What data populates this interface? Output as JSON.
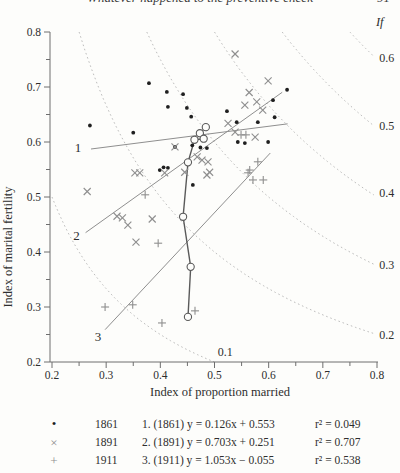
{
  "page_header": {
    "title": "Whatever happened to the preventive check",
    "page_number": "91"
  },
  "colors": {
    "dots": "#1f1f1f",
    "cross_plus": "#8f8f8f",
    "regression": "#8f8f8f",
    "trajectory": "#5a5a5a",
    "contour": "#bdbdbd",
    "axis": "#6e6e6e",
    "text": "#2e2e2e"
  },
  "chart_data": {
    "type": "scatter",
    "xlabel": "Index of proportion married",
    "ylabel": "Index of marital fertility",
    "xlim": [
      0.2,
      0.8
    ],
    "ylim": [
      0.2,
      0.8
    ],
    "tick_minor_step": 0.05,
    "tick_label_step": 0.1,
    "grid": false,
    "if_label": {
      "text": "If",
      "x": 0.805,
      "y": 0.818
    },
    "contours": [
      {
        "value": 0.1,
        "label": "0.1",
        "label_x": 0.52,
        "label_y": 0.218
      },
      {
        "value": 0.2,
        "label": "0.2",
        "label_x": 0.818,
        "label_y": 0.249
      },
      {
        "value": 0.3,
        "label": "0.3",
        "label_x": 0.818,
        "label_y": 0.376
      },
      {
        "value": 0.4,
        "label": "0.4",
        "label_x": 0.818,
        "label_y": 0.508
      },
      {
        "value": 0.5,
        "label": "0.5",
        "label_x": 0.818,
        "label_y": 0.63
      },
      {
        "value": 0.6,
        "label": "0.6",
        "label_x": 0.818,
        "label_y": 0.752
      }
    ],
    "series": [
      {
        "name": "1861",
        "marker": "dot",
        "points": [
          [
            0.379,
            0.707
          ],
          [
            0.412,
            0.691
          ],
          [
            0.442,
            0.687
          ],
          [
            0.414,
            0.664
          ],
          [
            0.449,
            0.662
          ],
          [
            0.457,
            0.646
          ],
          [
            0.27,
            0.63
          ],
          [
            0.35,
            0.617
          ],
          [
            0.523,
            0.656
          ],
          [
            0.541,
            0.636
          ],
          [
            0.58,
            0.636
          ],
          [
            0.543,
            0.6
          ],
          [
            0.556,
            0.598
          ],
          [
            0.599,
            0.6
          ],
          [
            0.608,
            0.676
          ],
          [
            0.611,
            0.645
          ],
          [
            0.634,
            0.695
          ],
          [
            0.427,
            0.591
          ],
          [
            0.486,
            0.589
          ],
          [
            0.459,
            0.594
          ],
          [
            0.474,
            0.59
          ],
          [
            0.399,
            0.549
          ],
          [
            0.406,
            0.554
          ],
          [
            0.414,
            0.553
          ],
          [
            0.46,
            0.522
          ]
        ]
      },
      {
        "name": "1891",
        "marker": "x",
        "points": [
          [
            0.538,
            0.76
          ],
          [
            0.599,
            0.711
          ],
          [
            0.564,
            0.69
          ],
          [
            0.578,
            0.673
          ],
          [
            0.556,
            0.667
          ],
          [
            0.589,
            0.658
          ],
          [
            0.525,
            0.634
          ],
          [
            0.538,
            0.618
          ],
          [
            0.575,
            0.609
          ],
          [
            0.427,
            0.591
          ],
          [
            0.468,
            0.573
          ],
          [
            0.265,
            0.51
          ],
          [
            0.353,
            0.544
          ],
          [
            0.362,
            0.544
          ],
          [
            0.408,
            0.544
          ],
          [
            0.445,
            0.545
          ],
          [
            0.477,
            0.567
          ],
          [
            0.488,
            0.564
          ],
          [
            0.491,
            0.545
          ],
          [
            0.486,
            0.54
          ],
          [
            0.32,
            0.465
          ],
          [
            0.33,
            0.462
          ],
          [
            0.34,
            0.449
          ],
          [
            0.385,
            0.46
          ],
          [
            0.355,
            0.418
          ]
        ]
      },
      {
        "name": "1911",
        "marker": "plus",
        "points": [
          [
            0.549,
            0.613
          ],
          [
            0.558,
            0.613
          ],
          [
            0.58,
            0.564
          ],
          [
            0.565,
            0.549
          ],
          [
            0.562,
            0.544
          ],
          [
            0.571,
            0.531
          ],
          [
            0.59,
            0.531
          ],
          [
            0.372,
            0.504
          ],
          [
            0.396,
            0.416
          ],
          [
            0.298,
            0.3
          ],
          [
            0.349,
            0.304
          ],
          [
            0.403,
            0.271
          ],
          [
            0.464,
            0.293
          ]
        ]
      }
    ],
    "regression_lines": [
      {
        "id": "1",
        "slope": 0.126,
        "intercept": 0.553,
        "x_start": 0.272,
        "x_end": 0.635,
        "label": "1",
        "label_x": 0.248,
        "label_y": 0.589
      },
      {
        "id": "2",
        "slope": 0.703,
        "intercept": 0.251,
        "x_start": 0.262,
        "x_end": 0.625,
        "label": "2",
        "label_x": 0.245,
        "label_y": 0.429
      },
      {
        "id": "3",
        "slope": 1.053,
        "intercept": -0.055,
        "x_start": 0.298,
        "x_end": 0.603,
        "label": "3",
        "label_x": 0.285,
        "label_y": 0.245
      }
    ],
    "trajectory": {
      "marker": "open-circle",
      "points": [
        [
          0.484,
          0.627
        ],
        [
          0.473,
          0.616
        ],
        [
          0.48,
          0.606
        ],
        [
          0.463,
          0.604
        ],
        [
          0.451,
          0.563
        ],
        [
          0.442,
          0.464
        ],
        [
          0.456,
          0.373
        ],
        [
          0.451,
          0.282
        ]
      ]
    }
  },
  "legend": {
    "rows": [
      {
        "marker": "dot",
        "year": "1861",
        "equation": "1. (1861) y = 0.126x + 0.553",
        "r2": "r² = 0.049"
      },
      {
        "marker": "x",
        "year": "1891",
        "equation": "2. (1891) y = 0.703x + 0.251",
        "r2": "r² = 0.707"
      },
      {
        "marker": "plus",
        "year": "1911",
        "equation": "3. (1911) y = 1.053x − 0.055",
        "r2": "r² = 0.538"
      }
    ],
    "marker_glyphs": {
      "dot": "•",
      "x": "×",
      "plus": "+"
    }
  }
}
